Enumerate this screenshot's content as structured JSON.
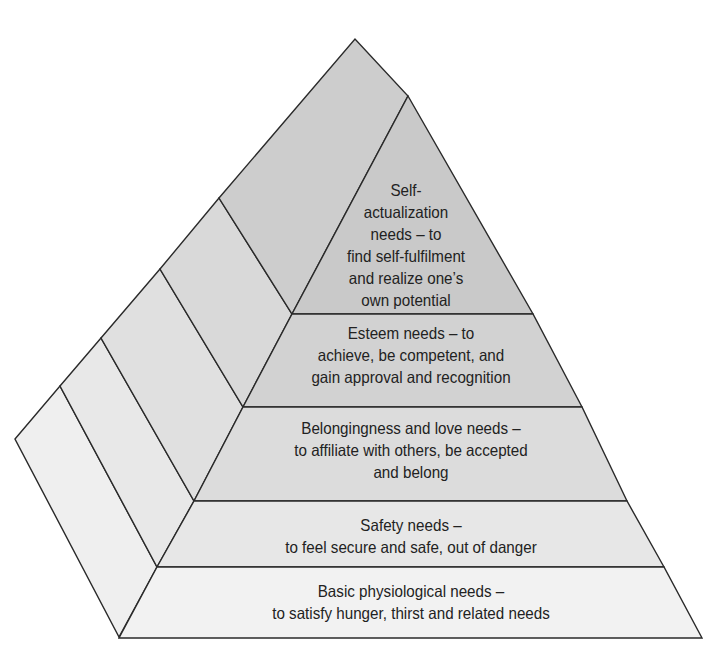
{
  "colors": {
    "stroke": "#2a2a2a",
    "text": "#222222",
    "fill_top": "#c8c8c8",
    "fill_bottom": "#f2f2f2"
  },
  "levels": [
    {
      "id": "self-actualization",
      "lines": [
        "Self-",
        "actualization",
        "needs – to",
        "find self-fulfilment",
        "and realize one’s",
        "own potential"
      ]
    },
    {
      "id": "esteem",
      "lines": [
        "Esteem needs – to",
        "achieve, be competent, and",
        "gain approval and recognition"
      ]
    },
    {
      "id": "belongingness",
      "lines": [
        "Belongingness and love needs –",
        "to affiliate with others, be accepted",
        "and belong"
      ]
    },
    {
      "id": "safety",
      "lines": [
        "Safety needs –",
        "to feel secure and safe, out of danger"
      ]
    },
    {
      "id": "physiological",
      "lines": [
        "Basic physiological needs –",
        "to satisfy hunger, thirst and related needs"
      ]
    }
  ]
}
